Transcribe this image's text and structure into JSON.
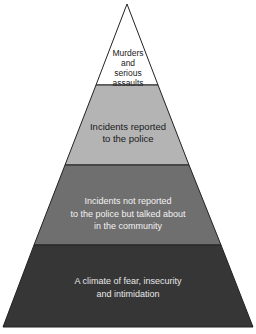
{
  "diagram": {
    "type": "pyramid",
    "levels": [
      {
        "lines": [
          "Murders",
          "and",
          "serious",
          "assaults"
        ],
        "fill": "#ffffff",
        "text_color": "#222222"
      },
      {
        "lines": [
          "Incidents reported",
          "to the police"
        ],
        "fill": "#b4b4b4",
        "text_color": "#1a1a1a"
      },
      {
        "lines": [
          "Incidents not reported",
          "to the police but talked about",
          "in the community"
        ],
        "fill": "#6f6f6f",
        "text_color": "#f2f2f2"
      },
      {
        "lines": [
          "A climate of fear, insecurity",
          "and intimidation"
        ],
        "fill": "#363636",
        "text_color": "#e8e8e8"
      }
    ]
  }
}
